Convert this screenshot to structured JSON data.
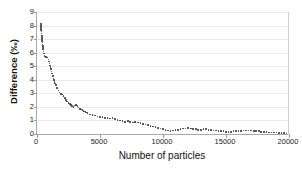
{
  "chart_data": {
    "type": "scatter",
    "title": "",
    "xlabel": "Number of particles",
    "ylabel": "Difference (‰)",
    "xlim": [
      0,
      20000
    ],
    "ylim": [
      0,
      9
    ],
    "xticks": [
      0,
      5000,
      10000,
      15000,
      20000
    ],
    "xtick_labels": [
      "0",
      "5000",
      "10000",
      "15000",
      "20000"
    ],
    "yticks": [
      0,
      1,
      2,
      3,
      4,
      5,
      6,
      7,
      8,
      9
    ],
    "ytick_labels": [
      "0",
      "1",
      "2",
      "3",
      "4",
      "5",
      "6",
      "7",
      "8",
      "9"
    ],
    "grid": "horizontal",
    "legend": "none",
    "marker": "small-dot",
    "marker_color": "#3a3a3a",
    "series": [
      {
        "name": "Difference",
        "x": [
          300,
          400,
          500,
          600,
          700,
          800,
          900,
          1000,
          1100,
          1200,
          1300,
          1400,
          1500,
          1600,
          1700,
          1800,
          1900,
          2000,
          2100,
          2200,
          2300,
          2400,
          2500,
          2600,
          2700,
          2800,
          2900,
          3000,
          3100,
          3200,
          3300,
          3400,
          3500,
          3600,
          3700,
          3800,
          3900,
          4000,
          4200,
          4400,
          4600,
          4800,
          5000,
          5200,
          5400,
          5600,
          5800,
          6000,
          6200,
          6400,
          6600,
          6800,
          7000,
          7200,
          7400,
          7600,
          7800,
          8000,
          8200,
          8400,
          8600,
          8800,
          9000,
          9200,
          9400,
          9600,
          9800,
          10000,
          10200,
          10400,
          10600,
          10800,
          11000,
          11200,
          11400,
          11600,
          11800,
          12000,
          12200,
          12400,
          12600,
          12800,
          13000,
          13200,
          13400,
          13600,
          13800,
          14000,
          14200,
          14400,
          14600,
          14800,
          15000,
          15200,
          15400,
          15600,
          15800,
          16000,
          16200,
          16400,
          16600,
          16800,
          17000,
          17200,
          17400,
          17600,
          17800,
          18000,
          18200,
          18400,
          18600,
          18800,
          19000,
          19200,
          19400,
          19600,
          19800,
          20000
        ],
        "y": [
          8.1,
          7.0,
          6.1,
          5.75,
          5.7,
          5.65,
          5.5,
          5.2,
          4.8,
          4.45,
          4.1,
          3.85,
          3.6,
          3.4,
          3.2,
          3.05,
          2.95,
          2.9,
          2.8,
          2.65,
          2.5,
          2.4,
          2.3,
          2.2,
          2.15,
          2.05,
          2.0,
          2.1,
          2.15,
          2.05,
          1.95,
          1.85,
          1.8,
          1.75,
          1.7,
          1.65,
          1.6,
          1.55,
          1.45,
          1.4,
          1.35,
          1.3,
          1.25,
          1.25,
          1.2,
          1.2,
          1.15,
          1.2,
          1.1,
          1.05,
          1.0,
          0.95,
          0.9,
          0.95,
          0.9,
          0.85,
          0.9,
          0.85,
          0.8,
          0.75,
          0.7,
          0.65,
          0.6,
          0.55,
          0.5,
          0.45,
          0.4,
          0.35,
          0.3,
          0.25,
          0.2,
          0.25,
          0.3,
          0.3,
          0.35,
          0.4,
          0.4,
          0.45,
          0.4,
          0.35,
          0.35,
          0.3,
          0.3,
          0.35,
          0.35,
          0.3,
          0.3,
          0.25,
          0.25,
          0.2,
          0.2,
          0.2,
          0.15,
          0.15,
          0.15,
          0.2,
          0.2,
          0.2,
          0.2,
          0.25,
          0.25,
          0.25,
          0.25,
          0.2,
          0.2,
          0.2,
          0.15,
          0.15,
          0.15,
          0.1,
          0.1,
          0.1,
          0.1,
          0.08,
          0.08,
          0.06,
          0.05,
          0.05
        ]
      }
    ]
  }
}
